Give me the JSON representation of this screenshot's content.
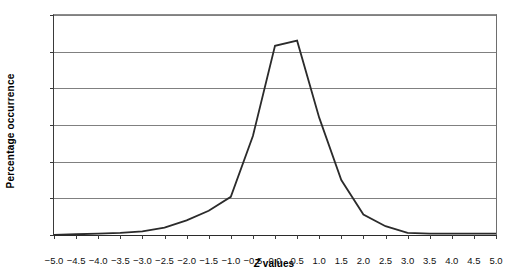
{
  "chart_data": {
    "type": "line",
    "title": "",
    "xlabel": "Z values",
    "ylabel": "Percentage occurrence",
    "xlim": [
      -5.0,
      5.0
    ],
    "ylim": [
      0,
      30
    ],
    "grid": true,
    "legend": "none",
    "x_tick_labels": [
      "-5.0",
      "-4.5",
      "-4.0",
      "-3.5",
      "-3.0",
      "-2.5",
      "-2.0",
      "-1.5",
      "-1.0",
      "-0.5",
      "0.0",
      "0.5",
      "1.0",
      "1.5",
      "2.0",
      "2.5",
      "3.0",
      "3.5",
      "4.0",
      "4.5",
      "5.0"
    ],
    "y_tick_labels": [
      "0%",
      "5%",
      "10%",
      "15%",
      "20%",
      "25%",
      "30%"
    ],
    "y_tick_values": [
      0,
      5,
      10,
      15,
      20,
      25,
      30
    ],
    "x": [
      -5.0,
      -4.5,
      -4.0,
      -3.5,
      -3.0,
      -2.5,
      -2.0,
      -1.5,
      -1.0,
      -0.5,
      0.0,
      0.5,
      1.0,
      1.5,
      2.0,
      2.5,
      3.0,
      3.5,
      4.0,
      4.5,
      5.0
    ],
    "values": [
      0.0,
      0.1,
      0.2,
      0.3,
      0.5,
      1.0,
      2.0,
      3.3,
      5.2,
      13.5,
      25.8,
      26.5,
      16.0,
      7.5,
      2.8,
      1.2,
      0.3,
      0.2,
      0.2,
      0.2,
      0.2
    ],
    "series": [
      {
        "name": "Percentage occurrence",
        "color": "#2b2b2b",
        "values": [
          0.0,
          0.1,
          0.2,
          0.3,
          0.5,
          1.0,
          2.0,
          3.3,
          5.2,
          13.5,
          25.8,
          26.5,
          16.0,
          7.5,
          2.8,
          1.2,
          0.3,
          0.2,
          0.2,
          0.2,
          0.2
        ]
      }
    ]
  },
  "axes": {
    "x_title_prefix": "Z",
    "x_title_suffix": " values",
    "y_title": "Percentage occurrence"
  }
}
